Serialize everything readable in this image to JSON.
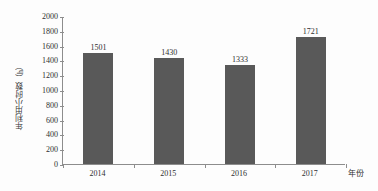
{
  "chart_data": {
    "type": "bar",
    "title": "",
    "subtitle": "",
    "categories": [
      "2014",
      "2015",
      "2016",
      "2017"
    ],
    "values": [
      1501,
      1430,
      1333,
      1721
    ],
    "value_labels": [
      "1501",
      "1430",
      "1333",
      "1721"
    ],
    "xlabel": "年份",
    "ylabel": "年利用小时数（h）",
    "ylim": [
      0,
      2000
    ],
    "y_ticks": [
      0,
      200,
      400,
      600,
      800,
      1000,
      1200,
      1400,
      1600,
      1800,
      2000
    ],
    "y_tick_labels": [
      "0",
      "200",
      "400",
      "600",
      "800",
      "1000",
      "1200",
      "1400",
      "1600",
      "1800",
      "2000"
    ],
    "grid": false,
    "legend": null,
    "legend_position": "none",
    "bar_color": "#595959",
    "axis_color": "#8d8d8d",
    "text_color": "#2f2f2f",
    "background_color": "#fdfdfd"
  }
}
